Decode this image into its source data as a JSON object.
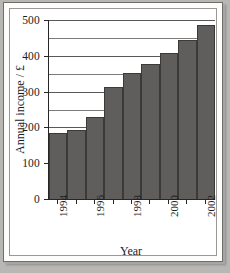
{
  "chart_data": {
    "type": "bar",
    "title": "",
    "xlabel": "Year",
    "ylabel": "Annual income / £",
    "categories": [
      "1994",
      "1995",
      "1996",
      "1997",
      "1998",
      "1999",
      "2000",
      "2001",
      "2002"
    ],
    "values": [
      184,
      192,
      228,
      314,
      352,
      377,
      407,
      443,
      487
    ],
    "tick_labels_shown": [
      "1994",
      "",
      "1996",
      "",
      "1998",
      "",
      "2000",
      "",
      "2002"
    ],
    "ytick_labels": [
      "0",
      "100",
      "200",
      "300",
      "400",
      "500"
    ],
    "ytick_values": [
      0,
      100,
      200,
      300,
      400,
      500
    ],
    "gridline_values": [
      50,
      100,
      150,
      200,
      250,
      300,
      350,
      400,
      450,
      500
    ],
    "ylim": [
      0,
      500
    ],
    "grid": "horizontal",
    "legend": "none",
    "bar_color": "#5f5e5d",
    "bar_edge_color": "#3b3a39",
    "axis_color": "#262626",
    "gridline_color": "#7d7b78",
    "plot_background": "#ffffff",
    "page_background": "#b9b7b3"
  }
}
